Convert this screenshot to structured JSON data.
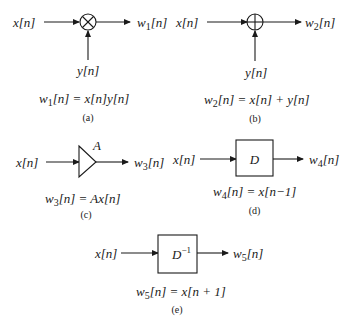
{
  "diagrams": {
    "a": {
      "input": "x[n]",
      "side_input": "y[n]",
      "operator_symbol": "×",
      "operator": "multiplier",
      "output_var": "w",
      "output_sub": "1",
      "output_rest": "[n]",
      "equation_lhs_var": "w",
      "equation_lhs_sub": "1",
      "equation_rhs": "[n] = x[n]y[n]",
      "caption": "(a)"
    },
    "b": {
      "input": "x[n]",
      "side_input": "y[n]",
      "operator_symbol": "+",
      "operator": "adder",
      "output_var": "w",
      "output_sub": "2",
      "output_rest": "[n]",
      "equation_lhs_var": "w",
      "equation_lhs_sub": "2",
      "equation_rhs": "[n] = x[n] + y[n]",
      "caption": "(b)"
    },
    "c": {
      "input": "x[n]",
      "gain_label": "A",
      "operator": "gain",
      "output_var": "w",
      "output_sub": "3",
      "output_rest": "[n]",
      "equation_lhs_var": "w",
      "equation_lhs_sub": "3",
      "equation_rhs": "[n] = Ax[n]",
      "caption": "(c)"
    },
    "d": {
      "input": "x[n]",
      "block_label": "D",
      "operator": "unit-delay",
      "output_var": "w",
      "output_sub": "4",
      "output_rest": "[n]",
      "equation_lhs_var": "w",
      "equation_lhs_sub": "4",
      "equation_rhs": "[n] = x[n−1]",
      "caption": "(d)"
    },
    "e": {
      "input": "x[n]",
      "block_label": "D",
      "block_sup": "−1",
      "operator": "unit-advance",
      "output_var": "w",
      "output_sub": "5",
      "output_rest": "[n]",
      "equation_lhs_var": "w",
      "equation_lhs_sub": "5",
      "equation_rhs": "[n] = x[n + 1]",
      "caption": "(e)"
    }
  }
}
